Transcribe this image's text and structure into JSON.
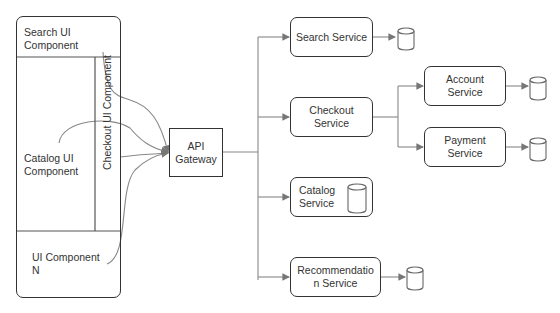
{
  "diagram": {
    "frontend": {
      "search_ui": "Search UI Component",
      "search_ui_line1": "Search UI",
      "search_ui_line2": "Component",
      "checkout_ui": "Checkout UI Component",
      "catalog_ui_line1": "Catalog UI",
      "catalog_ui_line2": "Component",
      "ui_n_line1": "UI Component",
      "ui_n_line2": "N"
    },
    "gateway": {
      "line1": "API",
      "line2": "Gateway"
    },
    "services": {
      "search": {
        "label": "Search Service",
        "has_db": true
      },
      "checkout": {
        "line1": "Checkout",
        "line2": "Service"
      },
      "account": {
        "line1": "Account",
        "line2": "Service",
        "has_db": true
      },
      "payment": {
        "line1": "Payment",
        "line2": "Service",
        "has_db": true
      },
      "catalog": {
        "line1": "Catalog",
        "line2": "Service",
        "has_db": true
      },
      "recommendation": {
        "line1": "Recommendatio",
        "line2": "n Service",
        "has_db": true
      }
    },
    "colors": {
      "stroke": "#333333",
      "arrow": "#777777",
      "background": "#ffffff"
    }
  }
}
